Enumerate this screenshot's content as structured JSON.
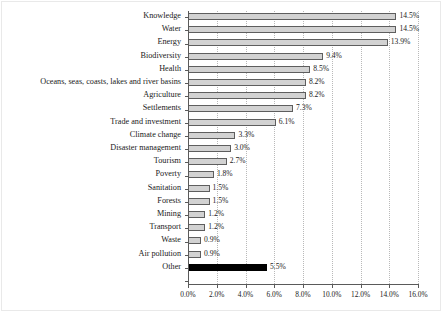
{
  "chart_data": {
    "type": "bar",
    "orientation": "horizontal",
    "title": "",
    "subtitle": "",
    "xlabel": "",
    "ylabel": "",
    "xlim": [
      0,
      16
    ],
    "xtick_values": [
      0,
      2,
      4,
      6,
      8,
      10,
      12,
      14,
      16
    ],
    "xtick_labels": [
      "0.0%",
      "2.0%",
      "4.0%",
      "6.0%",
      "8.0%",
      "10.0%",
      "12.0%",
      "14.0%",
      "16.0%"
    ],
    "grid": "vertical-dotted",
    "legend": "none",
    "value_label_suffix": "%",
    "categories": [
      "Knowledge",
      "Water",
      "Energy",
      "Biodiversity",
      "Health",
      "Oceans, seas, coasts, lakes and river basins",
      "Agriculture",
      "Settlements",
      "Trade and investment",
      "Climate change",
      "Disaster management",
      "Tourism",
      "Poverty",
      "Sanitation",
      "Forests",
      "Mining",
      "Transport",
      "Waste",
      "Air pollution",
      "Other"
    ],
    "values": [
      14.5,
      14.5,
      13.9,
      9.4,
      8.5,
      8.2,
      8.2,
      7.3,
      6.1,
      3.3,
      3.0,
      2.7,
      1.8,
      1.5,
      1.5,
      1.2,
      1.2,
      0.9,
      0.9,
      5.5
    ],
    "value_labels": [
      "14.5%",
      "14.5%",
      "13.9%",
      "9.4%",
      "8.5%",
      "8.2%",
      "8.2%",
      "7.3%",
      "6.1%",
      "3.3%",
      "3.0%",
      "2.7%",
      "1.8%",
      "1.5%",
      "1.5%",
      "1.2%",
      "1.2%",
      "0.9%",
      "0.9%",
      "5.5%"
    ],
    "bar_colors": [
      "#d2d2d2",
      "#d2d2d2",
      "#d2d2d2",
      "#d2d2d2",
      "#d2d2d2",
      "#d2d2d2",
      "#d2d2d2",
      "#d2d2d2",
      "#d2d2d2",
      "#d2d2d2",
      "#d2d2d2",
      "#d2d2d2",
      "#d2d2d2",
      "#d2d2d2",
      "#d2d2d2",
      "#d2d2d2",
      "#d2d2d2",
      "#d2d2d2",
      "#d2d2d2",
      "#000000"
    ],
    "bar_edge_color": "#5e5e5e",
    "highlight_category": "Other",
    "highlight_color": "#000000",
    "gridline_color": "#b9b9b9",
    "axis_color": "#5a5a5a",
    "text_color": "#1a1a1a"
  }
}
